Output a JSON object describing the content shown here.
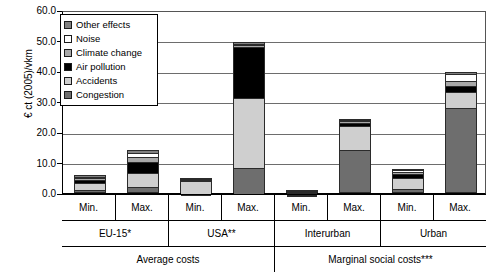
{
  "chart_data": {
    "type": "bar",
    "title": "",
    "xlabel": "",
    "ylabel": "€ ct (2005)/vkm",
    "ylim": [
      0,
      60
    ],
    "yticks": [
      "0.0",
      "10.0",
      "20.0",
      "30.0",
      "40.0",
      "50.0",
      "60.0"
    ],
    "grid": true,
    "stacked": true,
    "legend_position": "upper-left-inside",
    "legend": [
      {
        "name": "Other effects",
        "color": "#808080"
      },
      {
        "name": "Noise",
        "color": "#ffffff"
      },
      {
        "name": "Climate change",
        "color": "#a8a8a8"
      },
      {
        "name": "Air pollution",
        "color": "#000000"
      },
      {
        "name": "Accidents",
        "color": "#cfcfcf"
      },
      {
        "name": "Congestion",
        "color": "#6e6e6e"
      }
    ],
    "categories": [
      "Min.",
      "Max.",
      "Min.",
      "Max.",
      "Min.",
      "Max.",
      "Min.",
      "Max."
    ],
    "groups": [
      "EU-15*",
      "USA**",
      "Interurban",
      "Urban"
    ],
    "supergroups": [
      "Average costs",
      "Marginal social costs***"
    ],
    "series": [
      {
        "name": "Congestion",
        "values": [
          1.0,
          2.0,
          0.2,
          9.0,
          0.15,
          14.0,
          1.3,
          28.0
        ]
      },
      {
        "name": "Accidents",
        "values": [
          2.2,
          4.6,
          4.4,
          23.0,
          0.2,
          8.0,
          3.6,
          5.0
        ]
      },
      {
        "name": "Air pollution",
        "values": [
          0.9,
          3.4,
          0.2,
          16.8,
          0.25,
          1.0,
          1.2,
          2.2
        ]
      },
      {
        "name": "Climate change",
        "values": [
          0.7,
          1.7,
          0.1,
          0.3,
          0.15,
          0.6,
          0.7,
          1.4
        ]
      },
      {
        "name": "Noise",
        "values": [
          0.6,
          1.5,
          0.1,
          0.2,
          0.1,
          0.5,
          0.6,
          2.3
        ]
      },
      {
        "name": "Other effects",
        "values": [
          0.6,
          0.8,
          0.0,
          0.2,
          0.1,
          0.3,
          0.4,
          0.8
        ]
      }
    ],
    "totals": [
      6.0,
      14.0,
      5.0,
      49.5,
      0.95,
      24.4,
      7.8,
      39.7
    ]
  },
  "axis": {
    "y_title": "€ ct (2005)/vkm"
  },
  "structure": {
    "leaf_labels": [
      "Min.",
      "Max.",
      "Min.",
      "Max.",
      "Min.",
      "Max.",
      "Min.",
      "Max."
    ],
    "group_labels": [
      "EU-15*",
      "USA**",
      "Interurban",
      "Urban"
    ],
    "super_labels": [
      "Average costs",
      "Marginal social costs***"
    ]
  }
}
